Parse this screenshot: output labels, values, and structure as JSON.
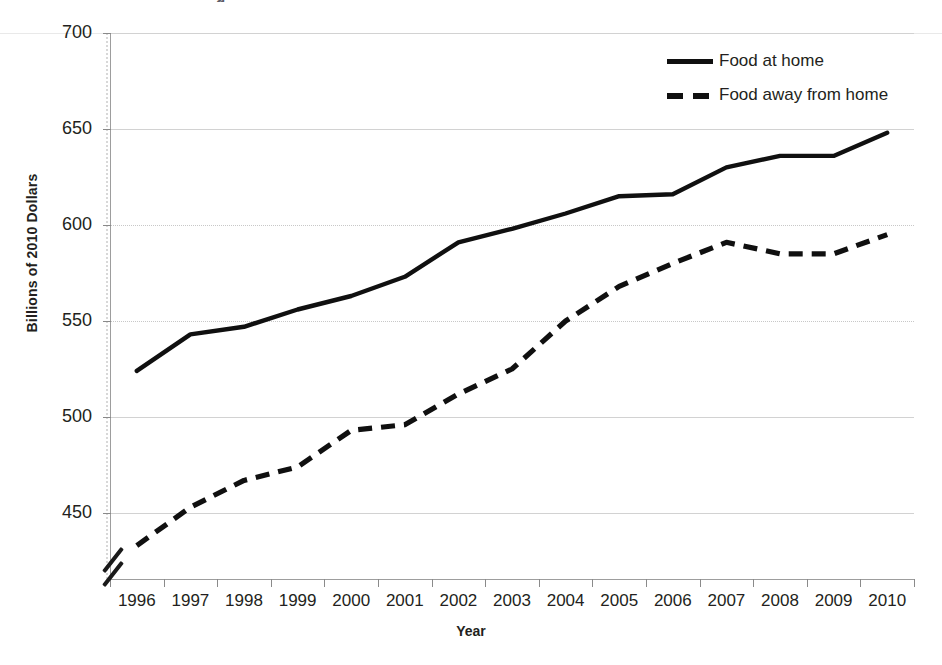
{
  "chart_data": {
    "type": "line",
    "title": "",
    "xlabel": "Year",
    "ylabel": "Billions of 2010 Dollars",
    "x": [
      1996,
      1997,
      1998,
      1999,
      2000,
      2001,
      2002,
      2003,
      2004,
      2005,
      2006,
      2007,
      2008,
      2009,
      2010
    ],
    "xtick_labels": [
      "1996",
      "1997",
      "1998",
      "1999",
      "2000",
      "2001",
      "2002",
      "2003",
      "2004",
      "2005",
      "2006",
      "2007",
      "2008",
      "2009",
      "2010"
    ],
    "ytick_labels": [
      "700",
      "650",
      "600",
      "550",
      "500",
      "450"
    ],
    "ytick_values": [
      700,
      650,
      600,
      550,
      500,
      450
    ],
    "ylim": [
      412,
      700
    ],
    "y_axis_break": true,
    "grid": true,
    "legend_position": "top-right",
    "series": [
      {
        "name": "Food at home",
        "style": "solid",
        "color": "#101010",
        "values": [
          524,
          543,
          547,
          556,
          563,
          573,
          591,
          598,
          606,
          615,
          616,
          630,
          636,
          636,
          648
        ]
      },
      {
        "name": "Food away from home",
        "style": "dashed",
        "color": "#101010",
        "values": [
          433,
          453,
          467,
          474,
          493,
          496,
          512,
          525,
          550,
          568,
          580,
          591,
          585,
          585,
          595
        ]
      }
    ]
  },
  "axes": {
    "y_title": "Billions of 2010 Dollars",
    "x_title": "Year"
  },
  "legend": {
    "items": [
      {
        "label": "Food at home",
        "style": "solid"
      },
      {
        "label": "Food away from home",
        "style": "dashed"
      }
    ]
  },
  "title_remnant": "g"
}
